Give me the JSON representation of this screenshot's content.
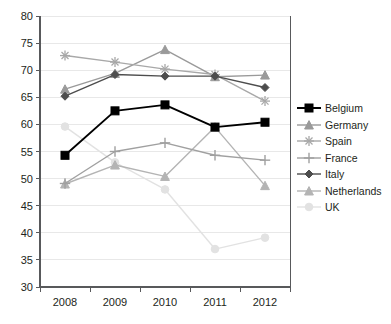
{
  "chart_data": {
    "type": "line",
    "title": "",
    "subtitle": "",
    "xlabel": "",
    "ylabel": "",
    "categories": [
      "2008",
      "2009",
      "2010",
      "2011",
      "2012"
    ],
    "x": [
      2008,
      2009,
      2010,
      2011,
      2012
    ],
    "xlim": [
      2007.6,
      2012.4
    ],
    "ylim": [
      30,
      80
    ],
    "yticks": [
      30,
      35,
      40,
      45,
      50,
      55,
      60,
      65,
      70,
      75,
      80
    ],
    "grid": "horizontal",
    "legend_position": "right",
    "series": [
      {
        "name": "Belgium",
        "color": "#000000",
        "marker": "square",
        "values": [
          54.3,
          62.5,
          63.6,
          59.5,
          60.4
        ]
      },
      {
        "name": "Germany",
        "color": "#9a9a9a",
        "marker": "triangle",
        "values": [
          66.5,
          69.4,
          73.8,
          68.8,
          69.1
        ]
      },
      {
        "name": "Spain",
        "color": "#a8a8a8",
        "marker": "asterisk",
        "values": [
          72.7,
          71.5,
          70.2,
          69.2,
          64.3
        ]
      },
      {
        "name": "France",
        "color": "#a0a0a0",
        "marker": "plus",
        "values": [
          49.1,
          55.0,
          56.6,
          54.3,
          53.4
        ]
      },
      {
        "name": "Italy",
        "color": "#4d4d4d",
        "marker": "diamond",
        "values": [
          65.2,
          69.2,
          68.9,
          68.9,
          66.8
        ]
      },
      {
        "name": "Netherlands",
        "color": "#b4b4b4",
        "marker": "triangle",
        "values": [
          49.0,
          52.5,
          50.4,
          59.5,
          48.7
        ]
      },
      {
        "name": "UK",
        "color": "#e2e2e2",
        "marker": "circle",
        "values": [
          59.6,
          53.0,
          48.0,
          37.0,
          39.1
        ]
      }
    ]
  },
  "axes": {
    "y_tick_labels": [
      "80",
      "75",
      "70",
      "65",
      "60",
      "55",
      "50",
      "45",
      "40",
      "35",
      "30"
    ],
    "x_tick_labels": [
      "2008",
      "2009",
      "2010",
      "2011",
      "2012"
    ]
  },
  "legend": {
    "items": [
      {
        "label": "Belgium"
      },
      {
        "label": "Germany"
      },
      {
        "label": "Spain"
      },
      {
        "label": "France"
      },
      {
        "label": "Italy"
      },
      {
        "label": "Netherlands"
      },
      {
        "label": "UK"
      }
    ]
  },
  "colors": {
    "axis": "#58595b",
    "grid": "#e8e8e8",
    "text": "#231f20",
    "belgium": "#000000",
    "germany": "#9a9a9a",
    "spain": "#a8a8a8",
    "france": "#a0a0a0",
    "italy": "#4d4d4d",
    "netherlands": "#b4b4b4",
    "uk": "#e2e2e2"
  }
}
